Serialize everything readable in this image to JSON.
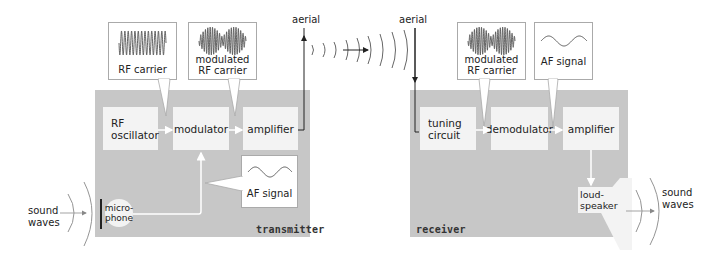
{
  "transmitter": {
    "label": "transmitter",
    "blocks": {
      "rf_oscillator": "RF\noscillator",
      "modulator": "modulator",
      "amplifier": "amplifier"
    },
    "microphone": "micro-\nphone",
    "callouts": {
      "rf_carrier": "RF carrier",
      "modulated_rf_carrier": "modulated\nRF carrier",
      "af_signal": "AF signal"
    },
    "aerial": "aerial",
    "sound_waves": "sound\nwaves"
  },
  "receiver": {
    "label": "receiver",
    "blocks": {
      "tuning_circuit": "tuning\ncircuit",
      "demodulator": "demodulator",
      "amplifier": "amplifier"
    },
    "loudspeaker": "loud-\nspeaker",
    "callouts": {
      "modulated_rf_carrier": "modulated\nRF carrier",
      "af_signal": "AF signal"
    },
    "aerial": "aerial",
    "sound_waves": "sound\nwaves"
  },
  "colors": {
    "panel": "#c7c7c7",
    "block": "#f3f3f3",
    "line": "#333333",
    "wave": "#666666"
  }
}
